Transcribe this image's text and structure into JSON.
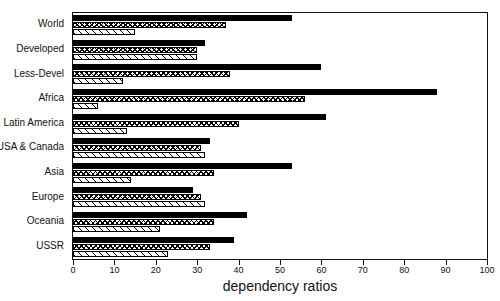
{
  "chart_data": {
    "type": "bar",
    "orientation": "horizontal",
    "title": "",
    "xlabel": "dependency ratios",
    "ylabel": "",
    "xlim": [
      0,
      100
    ],
    "xticks": [
      0,
      10,
      20,
      30,
      40,
      50,
      60,
      70,
      80,
      90,
      100
    ],
    "grid": false,
    "legend": "none",
    "categories": [
      "World",
      "Developed",
      "Less-Devel",
      "Africa",
      "Latin America",
      "USA & Canada",
      "Asia",
      "Europe",
      "Oceania",
      "USSR"
    ],
    "series": [
      {
        "name": "total dependency ratio",
        "pattern": "solid-black",
        "values": [
          53,
          32,
          60,
          88,
          61,
          33,
          53,
          29,
          42,
          39
        ]
      },
      {
        "name": "youth dependency ratio",
        "pattern": "cross-hatch",
        "values": [
          37,
          30,
          38,
          56,
          40,
          31,
          34,
          31,
          34,
          33
        ]
      },
      {
        "name": "old-age dependency ratio",
        "pattern": "diagonal-hatch",
        "values": [
          15,
          30,
          12,
          6,
          13,
          32,
          14,
          32,
          21,
          23
        ]
      }
    ]
  },
  "axis": {
    "x_title": "dependency ratios",
    "tick_labels": [
      "0",
      "10",
      "20",
      "30",
      "40",
      "50",
      "60",
      "70",
      "80",
      "90",
      "100"
    ]
  }
}
